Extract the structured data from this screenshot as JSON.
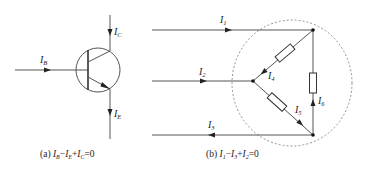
{
  "figure_a": {
    "labels": {
      "ib": {
        "main": "I",
        "sub": "B"
      },
      "ic": {
        "main": "I",
        "sub": "C"
      },
      "ie": {
        "main": "I",
        "sub": "E"
      }
    },
    "caption": {
      "prefix": "(a) ",
      "t1": "I",
      "s1": "B",
      "op1": "−",
      "t2": "I",
      "s2": "E",
      "op2": "+",
      "t3": "I",
      "s3": "C",
      "tail": "=0"
    }
  },
  "figure_b": {
    "labels": {
      "i1": {
        "main": "I",
        "sub": "1"
      },
      "i2": {
        "main": "I",
        "sub": "2"
      },
      "i3": {
        "main": "I",
        "sub": "3"
      },
      "i4": {
        "main": "I",
        "sub": "4"
      },
      "i5": {
        "main": "I",
        "sub": "5"
      },
      "i6": {
        "main": "I",
        "sub": "6"
      }
    },
    "caption": {
      "prefix": "(b) ",
      "t1": "I",
      "s1": "1",
      "op1": "−",
      "t2": "I",
      "s2": "3",
      "op2": "+",
      "t3": "I",
      "s3": "2",
      "tail": "=0"
    }
  },
  "colors": {
    "wire": "#555555",
    "dashed_boundary": "#777777",
    "text": "#222222"
  }
}
